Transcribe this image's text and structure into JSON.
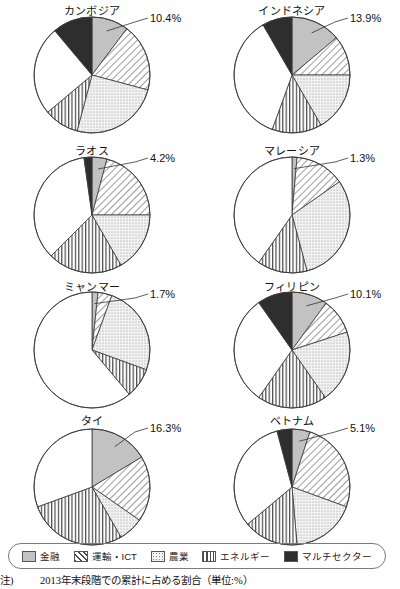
{
  "note": {
    "marker": "注)",
    "text": "2013年末段階での累計に占める割合（単位:%）"
  },
  "legend": {
    "items": [
      {
        "label": "金融",
        "pattern": "solid-gray",
        "color": "#bfbfbf"
      },
      {
        "label": "運輸・ICT",
        "pattern": "diagonal",
        "color": "#ffffff"
      },
      {
        "label": "農業",
        "pattern": "dots",
        "color": "#eeeeee"
      },
      {
        "label": "エネルギー",
        "pattern": "vertical",
        "color": "#ffffff"
      },
      {
        "label": "マルチセクター",
        "pattern": "solid-black",
        "color": "#2b2b2b"
      }
    ]
  },
  "chart_data": {
    "type": "pie",
    "title": "2013年末段階での累計に占める割合（単位:%）",
    "legend_position": "bottom",
    "categories": [
      "金融",
      "運輸・ICT",
      "農業",
      "エネルギー",
      "その他",
      "マルチセクター"
    ],
    "charts": [
      {
        "name": "カンボジア",
        "label_value": "10.4%",
        "values": [
          10.4,
          18.9,
          25.0,
          9.7,
          25.0,
          11.0
        ],
        "angles": [
          37,
          105,
          195,
          230,
          320,
          360
        ]
      },
      {
        "name": "インドネシア",
        "label_value": "13.9%",
        "values": [
          13.9,
          11.1,
          16.7,
          13.9,
          36.1,
          8.3
        ],
        "angles": [
          50,
          90,
          150,
          200,
          330,
          360
        ]
      },
      {
        "name": "ラオス",
        "label_value": "4.2%",
        "values": [
          4.2,
          20.8,
          16.7,
          20.8,
          35.3,
          2.2
        ],
        "angles": [
          15,
          90,
          150,
          225,
          352,
          360
        ]
      },
      {
        "name": "マレーシア",
        "label_value": "1.3%",
        "values": [
          1.3,
          13.9,
          30.6,
          13.9,
          40.3,
          0.0
        ],
        "angles": [
          5,
          55,
          165,
          215,
          360,
          360
        ]
      },
      {
        "name": "ミャンマー",
        "label_value": "1.7%",
        "values": [
          1.7,
          3.9,
          25.0,
          8.3,
          61.1,
          0.0
        ],
        "angles": [
          6,
          20,
          110,
          140,
          360,
          360
        ]
      },
      {
        "name": "フィリピン",
        "label_value": "10.1%",
        "values": [
          10.1,
          10.0,
          20.3,
          19.4,
          30.6,
          9.7
        ],
        "angles": [
          36,
          72,
          145,
          215,
          325,
          360
        ]
      },
      {
        "name": "タイ",
        "label_value": "16.3%",
        "values": [
          16.3,
          18.3,
          6.9,
          27.8,
          30.6,
          0.0
        ],
        "angles": [
          59,
          125,
          150,
          250,
          360,
          360
        ]
      },
      {
        "name": "ベトナム",
        "label_value": "5.1%",
        "values": [
          5.1,
          25.6,
          18.1,
          15.3,
          31.9,
          4.2
        ],
        "angles": [
          18,
          110,
          175,
          230,
          345,
          360
        ]
      }
    ]
  }
}
